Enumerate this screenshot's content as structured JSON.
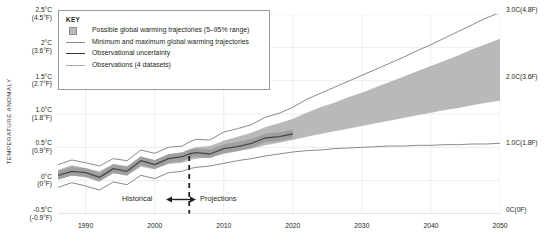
{
  "axes": {
    "left_title": "TEMPERATURE ANOMALY",
    "right_title": "TEMPERATURE ANOMALY RELATIVE TO THE PERIOD 1850–1900",
    "left_ticks": [
      {
        "c": "2.5°C",
        "f": "(4.5°F)",
        "value": 2.5
      },
      {
        "c": "2°C",
        "f": "(3.6°F)",
        "value": 2.0
      },
      {
        "c": "1.5°C",
        "f": "(2.7°F)",
        "value": 1.5
      },
      {
        "c": "1.0°C",
        "f": "(1.8°F)",
        "value": 1.0
      },
      {
        "c": "0.5°C",
        "f": "(0.9°F)",
        "value": 0.5
      },
      {
        "c": "0°C",
        "f": "(0°F)",
        "value": 0.0
      },
      {
        "c": "-0.5°C",
        "f": "(-0.9°F)",
        "value": -0.5
      }
    ],
    "right_ticks": [
      {
        "c": "3.0C",
        "f": "(4.8F)",
        "value": 3.0
      },
      {
        "c": "2.0C",
        "f": "(3.6F)",
        "value": 2.0
      },
      {
        "c": "1.0C",
        "f": "(1.8F)",
        "value": 1.0
      },
      {
        "c": "0C",
        "f": "(0F)",
        "value": 0.0
      }
    ],
    "x_ticks": [
      "1990",
      "2000",
      "2010",
      "2020",
      "2030",
      "2040",
      "2050"
    ]
  },
  "legend": {
    "title": "KEY",
    "items": [
      {
        "mark": "swatch",
        "label": "Possible global warming trajectories (5–95% range)"
      },
      {
        "mark": "thin-line",
        "label": "Minimum and maximum global warming trajectories"
      },
      {
        "mark": "dark-line",
        "label": "Observational uncertainty"
      },
      {
        "mark": "obs-line",
        "label": "Observations (4 datasets)"
      }
    ]
  },
  "eras": {
    "historical": "Historical",
    "projections": "Projections",
    "divider_year": 2005
  },
  "colors": {
    "band_fill": "#b9b9b9",
    "minmax_line": "#8a8a8a",
    "obs_uncertainty": "#4a4a4a",
    "observations": "#a8a8a8",
    "grid": "#e8e8e8",
    "text": "#231f20"
  },
  "chart_data": {
    "type": "area",
    "title": "",
    "xlabel": "",
    "ylabel": "TEMPERATURE ANOMALY",
    "xlim": [
      1986,
      2050
    ],
    "ylim": [
      -0.5,
      2.5
    ],
    "yright_lim": [
      0.0,
      3.0
    ],
    "grid": true,
    "legend_position": "top-left",
    "x": [
      1986,
      1988,
      1990,
      1992,
      1994,
      1996,
      1998,
      2000,
      2002,
      2004,
      2005,
      2006,
      2008,
      2010,
      2012,
      2014,
      2016,
      2018,
      2020,
      2022,
      2024,
      2026,
      2028,
      2030,
      2032,
      2034,
      2036,
      2038,
      2040,
      2042,
      2044,
      2046,
      2048,
      2050
    ],
    "series": [
      {
        "name": "Maximum global warming trajectory",
        "values": [
          0.24,
          0.31,
          0.27,
          0.22,
          0.33,
          0.3,
          0.46,
          0.41,
          0.5,
          0.52,
          0.58,
          0.62,
          0.61,
          0.73,
          0.78,
          0.84,
          0.95,
          1.01,
          1.1,
          1.22,
          1.31,
          1.4,
          1.49,
          1.58,
          1.67,
          1.76,
          1.85,
          1.95,
          2.04,
          2.14,
          2.24,
          2.34,
          2.44,
          2.52
        ]
      },
      {
        "name": "5–95% range upper bound",
        "values": [
          0.16,
          0.23,
          0.19,
          0.14,
          0.25,
          0.22,
          0.36,
          0.31,
          0.4,
          0.42,
          0.47,
          0.5,
          0.52,
          0.6,
          0.66,
          0.72,
          0.8,
          0.86,
          0.93,
          1.02,
          1.1,
          1.17,
          1.25,
          1.32,
          1.4,
          1.48,
          1.56,
          1.64,
          1.72,
          1.8,
          1.88,
          1.97,
          2.05,
          2.13
        ]
      },
      {
        "name": "5–95% range lower bound",
        "values": [
          0.02,
          0.08,
          0.05,
          0.0,
          0.11,
          0.08,
          0.21,
          0.17,
          0.25,
          0.27,
          0.31,
          0.33,
          0.35,
          0.4,
          0.44,
          0.48,
          0.53,
          0.57,
          0.61,
          0.66,
          0.7,
          0.74,
          0.78,
          0.82,
          0.86,
          0.9,
          0.94,
          0.98,
          1.02,
          1.06,
          1.09,
          1.13,
          1.17,
          1.2
        ]
      },
      {
        "name": "Minimum global warming trajectory",
        "values": [
          -0.1,
          -0.03,
          -0.08,
          -0.14,
          -0.02,
          -0.06,
          0.08,
          0.03,
          0.12,
          0.14,
          0.18,
          0.2,
          0.22,
          0.26,
          0.3,
          0.33,
          0.37,
          0.4,
          0.43,
          0.45,
          0.46,
          0.48,
          0.49,
          0.5,
          0.51,
          0.52,
          0.52,
          0.53,
          0.53,
          0.54,
          0.54,
          0.55,
          0.55,
          0.56
        ]
      },
      {
        "name": "Observations (4 datasets)",
        "values": [
          0.08,
          0.14,
          0.12,
          0.05,
          0.18,
          0.14,
          0.3,
          0.24,
          0.33,
          0.36,
          0.4,
          0.42,
          0.4,
          0.48,
          0.51,
          0.56,
          0.64,
          0.66,
          0.7,
          null,
          null,
          null,
          null,
          null,
          null,
          null,
          null,
          null,
          null,
          null,
          null,
          null,
          null,
          null
        ]
      }
    ]
  }
}
